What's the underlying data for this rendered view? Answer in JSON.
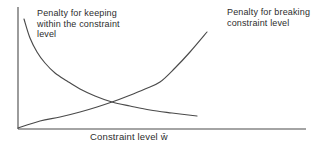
{
  "figure": {
    "background": "#ffffff",
    "line_color": "#4a4a4a",
    "text_color": "#2d2d2d"
  },
  "labels": {
    "keeping": {
      "line1": "Penalty for keeping",
      "line2": "within the constraint",
      "line3": "level"
    },
    "breaking": {
      "line1": "Penalty for breaking",
      "line2": "constraint level"
    },
    "x_axis": "Constraint level w̄"
  },
  "chart_data": {
    "type": "line",
    "title": "",
    "xlabel": "Constraint level w̄",
    "ylabel": "",
    "grid": false,
    "legend_position": "annotations-above-curves",
    "axes_px": {
      "origin": [
        18,
        129
      ],
      "x_end": [
        306,
        129
      ],
      "y_end": [
        18,
        7
      ]
    },
    "series": [
      {
        "name": "Penalty for keeping within the constraint level",
        "trend": "convex decreasing (high penalty at low constraint level, flattening toward zero)",
        "points_px": [
          [
            24,
            19
          ],
          [
            30,
            38
          ],
          [
            37,
            52
          ],
          [
            45,
            63
          ],
          [
            55,
            73
          ],
          [
            67,
            81
          ],
          [
            80,
            89
          ],
          [
            95,
            96
          ],
          [
            112,
            102
          ],
          [
            130,
            106
          ],
          [
            150,
            110
          ],
          [
            172,
            113
          ],
          [
            197,
            116
          ]
        ]
      },
      {
        "name": "Penalty for breaking constraint level",
        "trend": "convex increasing (near zero at origin, rising steeply at high constraint level)",
        "points_px": [
          [
            18,
            128
          ],
          [
            40,
            121
          ],
          [
            60,
            117
          ],
          [
            80,
            112
          ],
          [
            97,
            107
          ],
          [
            112,
            102
          ],
          [
            128,
            96
          ],
          [
            145,
            89
          ],
          [
            160,
            82
          ],
          [
            175,
            68
          ],
          [
            190,
            52
          ],
          [
            207,
            32
          ]
        ]
      }
    ],
    "intersection_px": [
      112,
      102
    ]
  }
}
